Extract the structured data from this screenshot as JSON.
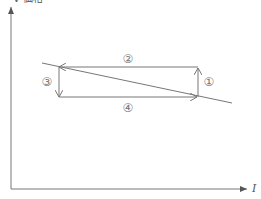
{
  "axes": {
    "y_label": "V 価格",
    "x_label": "I"
  },
  "cycle": {
    "steps": [
      {
        "id": 1,
        "label": "①",
        "direction": "up",
        "side": "right"
      },
      {
        "id": 2,
        "label": "②",
        "direction": "left",
        "side": "top"
      },
      {
        "id": 3,
        "label": "③",
        "direction": "down",
        "side": "left"
      },
      {
        "id": 4,
        "label": "④",
        "direction": "right",
        "side": "bottom"
      }
    ]
  },
  "colors": {
    "line": "#777777",
    "axis": "#777777",
    "background": "#ffffff"
  }
}
